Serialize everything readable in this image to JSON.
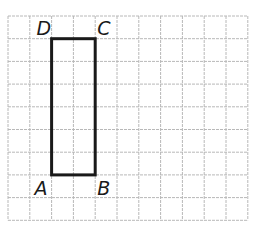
{
  "diagram": {
    "type": "rectangle-on-grid",
    "grid": {
      "columns": 11,
      "rows": 9,
      "origin_x": 8,
      "origin_y": 16,
      "cell_width": 21.8,
      "cell_height": 22.7,
      "line_color": "#b8b8b8"
    },
    "rectangle": {
      "stroke_color": "#1a1a1a",
      "stroke_width": 3,
      "grid_left": 2,
      "grid_right": 4,
      "grid_top": 1,
      "grid_bottom": 7,
      "width_units": 2,
      "height_units": 6
    },
    "vertices": [
      {
        "name": "A",
        "label": "A",
        "position": "bottom-left"
      },
      {
        "name": "B",
        "label": "B",
        "position": "bottom-right"
      },
      {
        "name": "C",
        "label": "C",
        "position": "top-right"
      },
      {
        "name": "D",
        "label": "D",
        "position": "top-left"
      }
    ]
  }
}
